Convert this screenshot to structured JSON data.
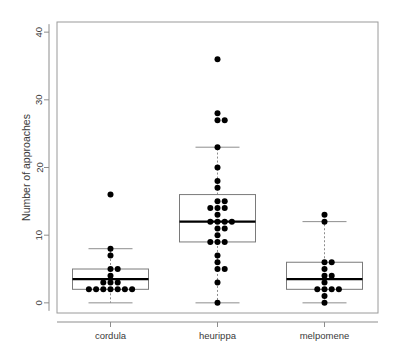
{
  "chart_data": {
    "type": "box",
    "title": "",
    "xlabel": "",
    "ylabel": "Number of approaches",
    "categories": [
      "cordula",
      "heurippa",
      "melpomene"
    ],
    "ylim": [
      -1.5,
      41.5
    ],
    "yticks": [
      0,
      10,
      20,
      30,
      40
    ],
    "ytick_labels": [
      "0",
      "10",
      "20",
      "30",
      "40"
    ],
    "grid": false,
    "legend": "none",
    "box_color": "#7a7a7a",
    "median_color": "#000000",
    "point_color": "#000000",
    "whisker_style": "dashed",
    "boxes": [
      {
        "category": "cordula",
        "min_whisker": 0,
        "q1": 2,
        "median": 3.5,
        "q3": 5,
        "max_whisker": 8,
        "outliers": [
          16
        ],
        "points": [
          16,
          8,
          7,
          5,
          5,
          4,
          3,
          3,
          3,
          2,
          2,
          2,
          2,
          2,
          2,
          2
        ]
      },
      {
        "category": "heurippa",
        "min_whisker": 0,
        "q1": 9,
        "median": 12,
        "q3": 16,
        "max_whisker": 23,
        "outliers": [
          36,
          28,
          27,
          27
        ],
        "points": [
          36,
          28,
          27,
          27,
          23,
          20,
          18,
          17,
          15,
          15,
          14,
          14,
          14,
          13,
          12,
          12,
          12,
          12,
          11,
          11,
          10,
          9,
          9,
          9,
          7,
          6,
          5,
          5,
          3,
          0
        ]
      },
      {
        "category": "melpomene",
        "min_whisker": 0,
        "q1": 2,
        "median": 3.5,
        "q3": 6,
        "max_whisker": 12,
        "outliers": [
          13
        ],
        "points": [
          13,
          12,
          6,
          6,
          5,
          4,
          4,
          3,
          2,
          2,
          2,
          2,
          1,
          0
        ]
      }
    ]
  },
  "axes": {
    "y_title": "Number of approaches"
  }
}
